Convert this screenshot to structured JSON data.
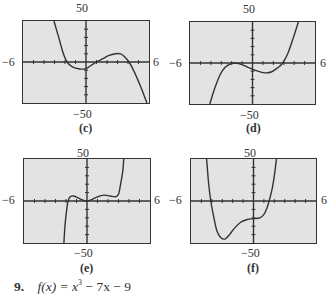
{
  "chart_data": [
    {
      "type": "line",
      "label": "(c)",
      "xlim": [
        -6,
        6
      ],
      "ylim": [
        -50,
        50
      ],
      "tick_labels": {
        "x_min": "−6",
        "x_max": "6",
        "y_max": "50",
        "y_min": "−50"
      },
      "grid": false,
      "x_ticks_step": 1,
      "y_ticks_step": 10,
      "points": [
        [
          -3.05,
          50
        ],
        [
          -2.6,
          30
        ],
        [
          -2.2,
          12
        ],
        [
          -1.8,
          0
        ],
        [
          -1.3,
          -6
        ],
        [
          -0.6,
          -8.5
        ],
        [
          0,
          -8
        ],
        [
          0.5,
          -4
        ],
        [
          1,
          0
        ],
        [
          1.6,
          4
        ],
        [
          2.2,
          8
        ],
        [
          2.8,
          10
        ],
        [
          3.3,
          10
        ],
        [
          3.7,
          6
        ],
        [
          4.1,
          0
        ],
        [
          4.6,
          -12
        ],
        [
          5.2,
          -30
        ],
        [
          5.8,
          -50
        ]
      ]
    },
    {
      "type": "line",
      "label": "(d)",
      "xlim": [
        -6,
        6
      ],
      "ylim": [
        -50,
        50
      ],
      "tick_labels": {
        "x_min": "−6",
        "x_max": "6",
        "y_max": "50",
        "y_min": "−50"
      },
      "grid": false,
      "x_ticks_step": 1,
      "y_ticks_step": 10,
      "points": [
        [
          -4.1,
          -50
        ],
        [
          -3.6,
          -30
        ],
        [
          -3.1,
          -14
        ],
        [
          -2.6,
          -5
        ],
        [
          -2.1,
          -1
        ],
        [
          -1.6,
          0
        ],
        [
          -1.0,
          -2
        ],
        [
          -0.3,
          -6
        ],
        [
          0.5,
          -10
        ],
        [
          1.2,
          -12
        ],
        [
          1.8,
          -11
        ],
        [
          2.4,
          -6
        ],
        [
          2.9,
          0
        ],
        [
          3.4,
          12
        ],
        [
          3.9,
          30
        ],
        [
          4.4,
          50
        ]
      ]
    },
    {
      "type": "line",
      "label": "(e)",
      "xlim": [
        -6,
        6
      ],
      "ylim": [
        -50,
        50
      ],
      "tick_labels": {
        "x_min": "−6",
        "x_max": "6",
        "y_max": "50",
        "y_min": "−50"
      },
      "grid": false,
      "x_ticks_step": 1,
      "y_ticks_step": 10,
      "points": [
        [
          -2.2,
          -50
        ],
        [
          -2.1,
          -30
        ],
        [
          -1.95,
          -12
        ],
        [
          -1.8,
          0
        ],
        [
          -1.6,
          5
        ],
        [
          -1.3,
          6
        ],
        [
          -0.9,
          4
        ],
        [
          -0.4,
          1
        ],
        [
          0,
          0
        ],
        [
          0.5,
          2
        ],
        [
          1.0,
          5
        ],
        [
          1.6,
          7
        ],
        [
          2.2,
          6
        ],
        [
          2.7,
          5
        ],
        [
          3.0,
          8
        ],
        [
          3.2,
          20
        ],
        [
          3.4,
          35
        ],
        [
          3.5,
          50
        ]
      ]
    },
    {
      "type": "line",
      "label": "(f)",
      "xlim": [
        -6,
        6
      ],
      "ylim": [
        -50,
        50
      ],
      "tick_labels": {
        "x_min": "−6",
        "x_max": "6",
        "y_max": "50",
        "y_min": "−50"
      },
      "grid": false,
      "x_ticks_step": 1,
      "y_ticks_step": 10,
      "points": [
        [
          -4.5,
          50
        ],
        [
          -4.3,
          20
        ],
        [
          -4.1,
          0
        ],
        [
          -3.8,
          -20
        ],
        [
          -3.5,
          -36
        ],
        [
          -3.1,
          -44
        ],
        [
          -2.7,
          -45
        ],
        [
          -2.3,
          -40
        ],
        [
          -1.8,
          -32
        ],
        [
          -1.2,
          -25
        ],
        [
          -0.6,
          -22
        ],
        [
          0,
          -21
        ],
        [
          0.6,
          -20
        ],
        [
          1.0,
          -16
        ],
        [
          1.3,
          -8
        ],
        [
          1.5,
          0
        ],
        [
          1.8,
          15
        ],
        [
          2.0,
          30
        ],
        [
          2.2,
          50
        ]
      ]
    }
  ],
  "panels": [
    {
      "caption": "(c)",
      "y_max": "50",
      "y_min": "−50",
      "x_min": "−6",
      "x_max": "6"
    },
    {
      "caption": "(d)",
      "y_max": "50",
      "y_min": "−50",
      "x_min": "−6",
      "x_max": "6"
    },
    {
      "caption": "(e)",
      "y_max": "50",
      "y_min": "−50",
      "x_min": "−6",
      "x_max": "6"
    },
    {
      "caption": "(f)",
      "y_max": "50",
      "y_min": "−50",
      "x_min": "−6",
      "x_max": "6"
    }
  ],
  "problem": {
    "number": "9.",
    "func_name": "f",
    "var": "x",
    "lhs": "f(x) =",
    "base": "x",
    "exponent": "3",
    "rest": " − 7x − 9"
  },
  "colors": {
    "plot_bg": "#e3e3e3",
    "frame": "#333333",
    "curve": "#333333"
  }
}
